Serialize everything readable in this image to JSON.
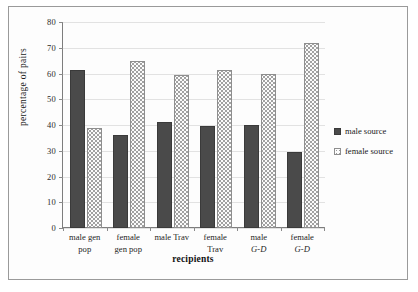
{
  "chart_data": {
    "type": "bar",
    "title": "",
    "xlabel": "recipients",
    "ylabel": "percentage of pairs",
    "ylim": [
      0,
      80
    ],
    "ytick_step": 10,
    "yticks": [
      "0",
      "10",
      "20",
      "30",
      "40",
      "50",
      "60",
      "70",
      "80"
    ],
    "grid": true,
    "legend_position": "right",
    "categories": [
      "male gen pop",
      "female gen pop",
      "male Trav",
      "female Trav",
      "male G-D",
      "female G-D"
    ],
    "category_lines": [
      [
        "male gen",
        "pop"
      ],
      [
        "female",
        "gen pop"
      ],
      [
        "male Trav",
        ""
      ],
      [
        "female",
        "Trav"
      ],
      [
        "male ",
        "G-D"
      ],
      [
        "female",
        "G-D"
      ]
    ],
    "series": [
      {
        "name": "male source",
        "swatch": "dark-filled-square",
        "values": [
          61.5,
          36,
          41,
          39.5,
          40,
          29.5
        ]
      },
      {
        "name": "female source",
        "swatch": "dotted-white-square",
        "values": [
          39,
          65,
          59.5,
          61.5,
          60,
          72
        ]
      }
    ]
  },
  "axis": {
    "y_title": "percentage of pairs",
    "x_title": "recipients"
  },
  "legend": {
    "items": [
      {
        "label": "male source",
        "icon": "filled-square-icon"
      },
      {
        "label": "female source",
        "icon": "dotted-square-icon"
      }
    ]
  },
  "colors": {
    "male_bar": "#4a4a4a",
    "female_bar": "#fbfbfb",
    "female_bar_border": "#8e8e8e",
    "gridline": "#e2e2e2",
    "axis": "#7d7d7d",
    "frame": "#9a9a9a",
    "text": "#1a1a1a"
  }
}
